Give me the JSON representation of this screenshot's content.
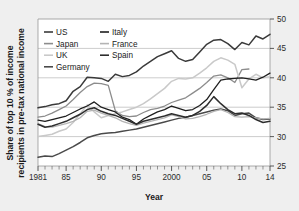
{
  "chart_data": {
    "type": "line",
    "title": "",
    "xlabel": "Year",
    "ylabel": "Share of top 10 % of income recipients in pre-tax national income",
    "ylabel_line1": "Share of top 10 % of income",
    "ylabel_line2": "recipients in pre-tax national income",
    "xlim": [
      1981,
      2014
    ],
    "ylim": [
      25,
      50
    ],
    "y_ticks": [
      25,
      30,
      35,
      40,
      45,
      50
    ],
    "y_tick_labels": [
      "25",
      "30",
      "35",
      "40",
      "45",
      "50"
    ],
    "y_axis_position": "right",
    "x_ticks": [
      1981,
      1985,
      1990,
      1995,
      2000,
      2005,
      2010,
      2014
    ],
    "x_tick_labels": [
      "1981",
      "85",
      "90",
      "95",
      "2000",
      "05",
      "10",
      "14"
    ],
    "x_minor_tick_step": 1,
    "grid": "horizontal",
    "legend_position": "top-left",
    "legend_columns": 2,
    "x": [
      1981,
      1982,
      1983,
      1984,
      1985,
      1986,
      1987,
      1988,
      1989,
      1990,
      1991,
      1992,
      1993,
      1994,
      1995,
      1996,
      1997,
      1998,
      1999,
      2000,
      2001,
      2002,
      2003,
      2004,
      2005,
      2006,
      2007,
      2008,
      2009,
      2010,
      2011,
      2012,
      2013,
      2014
    ],
    "series": [
      {
        "name": "US",
        "color": "#3a3a3a",
        "width": 1.5,
        "values": [
          34.9,
          35.1,
          35.4,
          35.6,
          36.1,
          37.7,
          38.5,
          40.1,
          40.0,
          39.9,
          39.4,
          40.6,
          40.2,
          40.4,
          41.0,
          42.0,
          42.8,
          43.6,
          44.1,
          44.6,
          43.3,
          42.8,
          43.1,
          44.4,
          45.7,
          46.4,
          46.5,
          45.8,
          44.8,
          46.0,
          45.6,
          47.1,
          46.6,
          47.4
        ]
      },
      {
        "name": "Japan",
        "color": "#8c8c8c",
        "width": 1.3,
        "values": [
          33.3,
          33.5,
          34.0,
          34.6,
          35.2,
          36.3,
          37.5,
          38.5,
          39.1,
          39.0,
          38.7,
          34.4,
          33.6,
          33.4,
          33.5,
          34.1,
          34.6,
          34.8,
          35.2,
          35.8,
          36.2,
          36.6,
          37.4,
          38.2,
          39.2,
          40.3,
          40.5,
          40.0,
          39.2,
          41.4,
          41.5,
          null,
          null,
          null
        ]
      },
      {
        "name": "UK",
        "color": "#c9c9c9",
        "width": 1.5,
        "values": [
          30.0,
          30.2,
          30.4,
          30.9,
          31.3,
          32.4,
          33.9,
          35.4,
          34.2,
          33.2,
          33.6,
          33.9,
          34.2,
          34.6,
          35.0,
          35.6,
          36.4,
          37.3,
          38.2,
          39.4,
          39.9,
          39.8,
          40.0,
          40.8,
          41.7,
          42.8,
          43.4,
          43.0,
          42.3,
          38.3,
          39.8,
          40.6,
          40.0,
          40.2
        ]
      },
      {
        "name": "Germany",
        "color": "#4a4a4a",
        "width": 1.5,
        "values": [
          26.5,
          26.7,
          26.6,
          27.1,
          27.7,
          28.3,
          29.0,
          29.8,
          30.2,
          30.5,
          30.6,
          30.7,
          30.9,
          31.1,
          31.3,
          31.6,
          31.9,
          32.2,
          32.5,
          32.8,
          33.1,
          33.3,
          33.6,
          33.9,
          34.2,
          34.5,
          34.7,
          34.4,
          33.6,
          33.9,
          34.0,
          33.2,
          32.9,
          33.0
        ]
      },
      {
        "name": "Italy",
        "color": "#1f1f1f",
        "width": 1.3,
        "values": [
          32.8,
          32.6,
          32.9,
          33.2,
          33.5,
          34.1,
          34.7,
          35.2,
          35.9,
          35.0,
          34.6,
          34.2,
          33.3,
          32.9,
          32.1,
          33.0,
          33.6,
          34.2,
          34.6,
          35.2,
          34.8,
          34.4,
          34.6,
          35.3,
          36.3,
          38.0,
          39.6,
          39.8,
          39.9,
          40.0,
          39.8,
          39.6,
          40.1,
          40.8
        ]
      },
      {
        "name": "France",
        "color": "#b4b4b4",
        "width": 1.3,
        "values": [
          32.2,
          31.7,
          31.6,
          31.9,
          32.2,
          32.6,
          33.2,
          34.3,
          34.5,
          34.0,
          33.6,
          33.2,
          32.6,
          32.2,
          31.9,
          32.3,
          32.6,
          32.9,
          33.2,
          33.7,
          33.4,
          33.0,
          33.1,
          33.4,
          33.8,
          34.3,
          34.6,
          34.1,
          33.4,
          33.3,
          33.4,
          33.2,
          33.0,
          33.1
        ]
      },
      {
        "name": "Spain",
        "color": "#2e2e2e",
        "width": 1.5,
        "values": [
          32.1,
          31.6,
          31.8,
          32.2,
          32.6,
          33.2,
          33.8,
          34.6,
          34.9,
          34.3,
          33.9,
          33.6,
          33.1,
          32.6,
          32.1,
          32.6,
          32.9,
          33.2,
          33.5,
          33.9,
          33.6,
          33.3,
          33.6,
          34.3,
          35.3,
          36.8,
          35.6,
          34.6,
          33.9,
          34.0,
          33.6,
          32.9,
          32.4,
          32.6
        ]
      }
    ]
  },
  "legend": {
    "column1": [
      {
        "label": "US",
        "color": "#3a3a3a"
      },
      {
        "label": "Japan",
        "color": "#8c8c8c"
      },
      {
        "label": "UK",
        "color": "#c9c9c9"
      },
      {
        "label": "Germany",
        "color": "#4a4a4a"
      }
    ],
    "column2": [
      {
        "label": "Italy",
        "color": "#1f1f1f"
      },
      {
        "label": "France",
        "color": "#b4b4b4"
      },
      {
        "label": "Spain",
        "color": "#2e2e2e"
      }
    ]
  },
  "colors": {
    "background": "#efefef",
    "plot_background": "#ffffff",
    "grid": "#a9a9a9",
    "frame": "#8a8a8a",
    "text": "#1a1a1a"
  }
}
